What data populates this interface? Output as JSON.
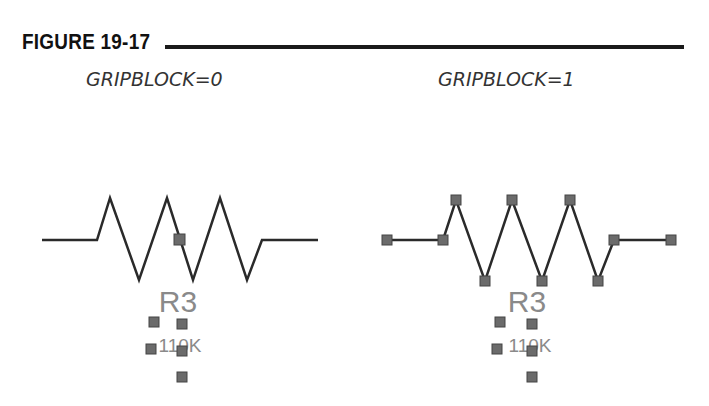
{
  "figure": {
    "title": "FIGURE 19-17"
  },
  "panels": [
    {
      "caption": "GRIPBLOCK=0",
      "ref": "R3",
      "value": "110K"
    },
    {
      "caption": "GRIPBLOCK=1",
      "ref": "R3",
      "value": "110K"
    }
  ],
  "colors": {
    "line": "#2a2a2a",
    "grip": "#6b6b6b",
    "grip_border": "#444444",
    "label": "#777777"
  }
}
